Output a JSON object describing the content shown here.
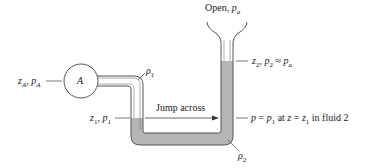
{
  "figure": {
    "colors": {
      "line": "#555555",
      "fluid2": "#b5b5b5",
      "background": "#ffffff"
    }
  },
  "labels": {
    "open": "Open, ",
    "open_p": "p",
    "open_sub": "a",
    "bulb": "A",
    "zA_pA": {
      "z": "z",
      "z_sub": "A",
      "sep": ", ",
      "p": "p",
      "p_sub": "A"
    },
    "z1_p1": {
      "z": "z",
      "z_sub": "1",
      "sep": ", ",
      "p": "p",
      "p_sub": "1"
    },
    "z2_p2": {
      "z": "z",
      "z_sub": "2",
      "sep": ", ",
      "p": "p",
      "p_sub": "2",
      "approx": " ≈ ",
      "pa": "p",
      "pa_sub": "a"
    },
    "rho1": {
      "sym": "ρ",
      "sub": "1"
    },
    "rho2": {
      "sym": "ρ",
      "sub": "2"
    },
    "jump": "Jump across",
    "eq": {
      "p": "p",
      "eq1": " = ",
      "p1": "p",
      "p1_sub": "1",
      "at": " at ",
      "z": "z",
      "eq2": " = ",
      "z1": "z",
      "z1_sub": "1",
      "tail": " in fluid 2"
    }
  }
}
